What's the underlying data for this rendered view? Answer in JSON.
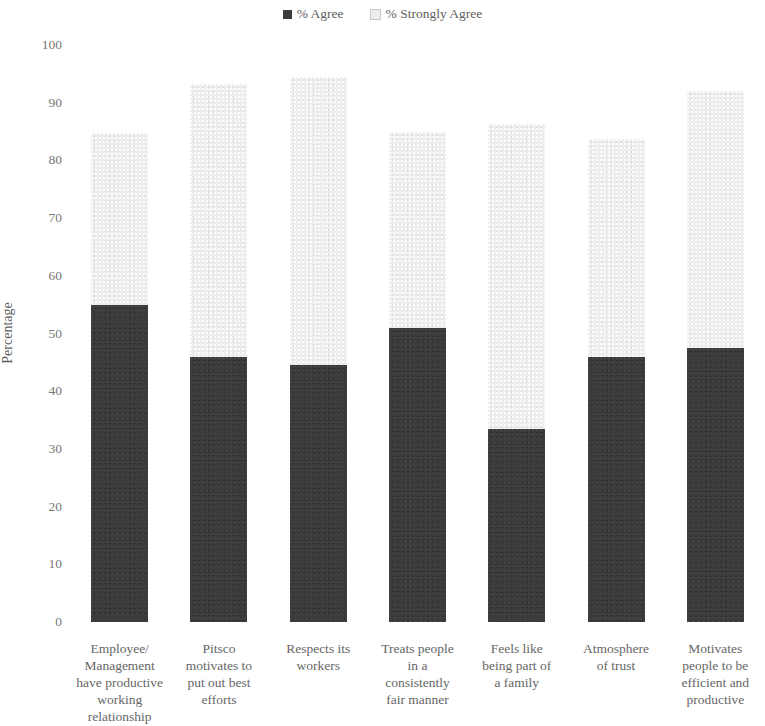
{
  "legend": {
    "items": [
      {
        "label": "% Agree",
        "color": "#3b3b3b",
        "key": "agree"
      },
      {
        "label": "% Strongly Agree",
        "color": "#ededed",
        "key": "strongly_agree"
      }
    ]
  },
  "axes": {
    "ylabel": "Percentage",
    "yticks": [
      "100",
      "90",
      "80",
      "70",
      "60",
      "50",
      "40",
      "30",
      "20",
      "10",
      "0"
    ]
  },
  "chart_data": {
    "type": "bar",
    "title": "",
    "subtitle": "",
    "xlabel": "",
    "ylabel": "Percentage",
    "ylim": [
      0,
      100
    ],
    "ytick_step": 10,
    "grid": false,
    "stacked": true,
    "legend_position": "top-center",
    "categories": [
      "Employee/ Management have productive working relationship",
      "Pitsco motivates to put out best efforts",
      "Respects its workers",
      "Treats people in a consistently fair manner",
      "Feels like being part of a family",
      "Atmosphere of trust",
      "Motivates people to be efficient and productive"
    ],
    "category_lines": [
      [
        "Employee/",
        "Management",
        "have productive",
        "working",
        "relationship"
      ],
      [
        "Pitsco",
        "motivates to",
        "put out best",
        "efforts"
      ],
      [
        "Respects its",
        "workers"
      ],
      [
        "Treats people",
        "in a",
        "consistently",
        "fair manner"
      ],
      [
        "Feels like",
        "being part of",
        "a family"
      ],
      [
        "Atmosphere",
        "of trust"
      ],
      [
        "Motivates",
        "people to be",
        "efficient and",
        "productive"
      ]
    ],
    "series": [
      {
        "name": "% Agree",
        "color": "#3b3b3b",
        "values": [
          55,
          46,
          44.5,
          51,
          33.5,
          46,
          47.5
        ]
      },
      {
        "name": "% Strongly Agree",
        "color": "#ededed",
        "values": [
          29.7,
          47.2,
          50,
          34,
          52.8,
          37.8,
          44.5
        ]
      }
    ],
    "totals": [
      84.7,
      93.2,
      94.5,
      85,
      86.3,
      83.8,
      92
    ]
  }
}
